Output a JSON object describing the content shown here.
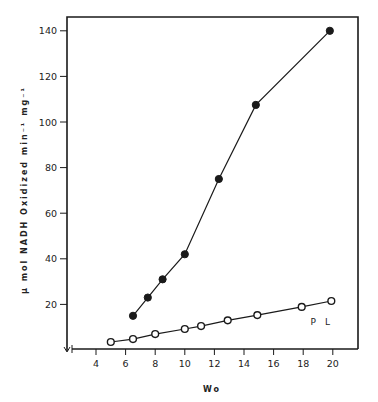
{
  "chart_data": {
    "type": "line",
    "title": "",
    "xlabel": "Wo",
    "ylabel": "μ mol NADH Oxidized min⁻¹ mg⁻¹",
    "xlim": [
      2.5,
      22
    ],
    "ylim": [
      0,
      145
    ],
    "xticks": [
      4,
      6,
      8,
      10,
      12,
      14,
      16,
      18,
      20
    ],
    "xtick_labels": [
      "4",
      "6",
      "8",
      "10",
      "12",
      "14",
      "16",
      "18",
      "20"
    ],
    "yticks": [
      20,
      40,
      60,
      80,
      100,
      120,
      140
    ],
    "ytick_labels": [
      "20",
      "40",
      "60",
      "80",
      "100",
      "120",
      "140"
    ],
    "grid": false,
    "legend": null,
    "annotations": [
      {
        "text": "P L",
        "x": 18.5,
        "y": 11
      }
    ],
    "series": [
      {
        "name": "filled circles",
        "marker": "filled-circle",
        "x": [
          6.5,
          7.5,
          8.5,
          10,
          12.3,
          14.8,
          19.8
        ],
        "y": [
          15,
          23,
          31,
          42,
          75,
          107.5,
          140
        ]
      },
      {
        "name": "open circles (PL)",
        "marker": "open-circle",
        "x": [
          5,
          6.5,
          8,
          10,
          11.1,
          12.9,
          14.9,
          17.9,
          19.9
        ],
        "y": [
          3.5,
          4.8,
          7,
          9.2,
          10.5,
          13,
          15.3,
          18.9,
          21.5
        ]
      }
    ]
  },
  "colors": {
    "ink": "#1a1a1a",
    "background": "#ffffff"
  }
}
